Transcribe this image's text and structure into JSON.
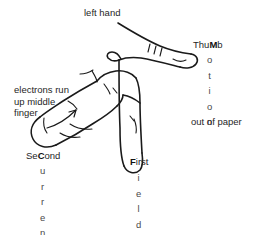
{
  "diagram": {
    "ink_color": "#1a1a1a",
    "text_color": "#262626",
    "vertical_text_color": "#4a4a4a",
    "background": "#ffffff"
  },
  "labels": {
    "left_hand": "left hand",
    "electrons_line1": "electrons run",
    "electrons_line2": "up middle",
    "electrons_line3": "finger",
    "out_of_paper": "out of paper",
    "thumb_head_pre": "Thu",
    "thumb_head_cap": "M",
    "thumb_head_post": "b",
    "second_head_pre": "Se",
    "second_head_cap": "C",
    "second_head_post": "ond",
    "first_head_cap": "F",
    "first_head_post": "irst"
  },
  "vertical_words": {
    "motion": [
      "o",
      "t",
      "i",
      "o",
      "n"
    ],
    "current": [
      "u",
      "r",
      "r",
      "e",
      "n",
      "t"
    ],
    "field": [
      "i",
      "e",
      "l",
      "d"
    ]
  },
  "mnemonic": {
    "thumb": "Motion",
    "first_finger": "Field",
    "second_finger": "Current"
  }
}
